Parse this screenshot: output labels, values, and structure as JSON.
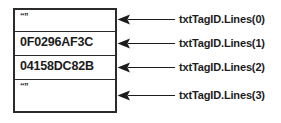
{
  "diagram": {
    "colors": {
      "border": "#2b2b2b",
      "text": "#1c1c1c",
      "arrow": "#1c1c1c",
      "background": "#ffffff"
    },
    "textbox": {
      "name": "txtTagID",
      "lines": [
        {
          "index": 0,
          "value": "“”",
          "is_empty": true
        },
        {
          "index": 1,
          "value": "0F0296AF3C",
          "is_empty": false
        },
        {
          "index": 2,
          "value": "04158DC82B",
          "is_empty": false
        },
        {
          "index": 3,
          "value": "“”",
          "is_empty": true
        }
      ]
    },
    "callouts": [
      {
        "label": "txtTagID.Lines(0)",
        "icon": "left-arrow-icon"
      },
      {
        "label": "txtTagID.Lines(1)",
        "icon": "left-arrow-icon"
      },
      {
        "label": "txtTagID.Lines(2)",
        "icon": "left-arrow-icon"
      },
      {
        "label": "txtTagID.Lines(3)",
        "icon": "left-arrow-icon"
      }
    ]
  }
}
